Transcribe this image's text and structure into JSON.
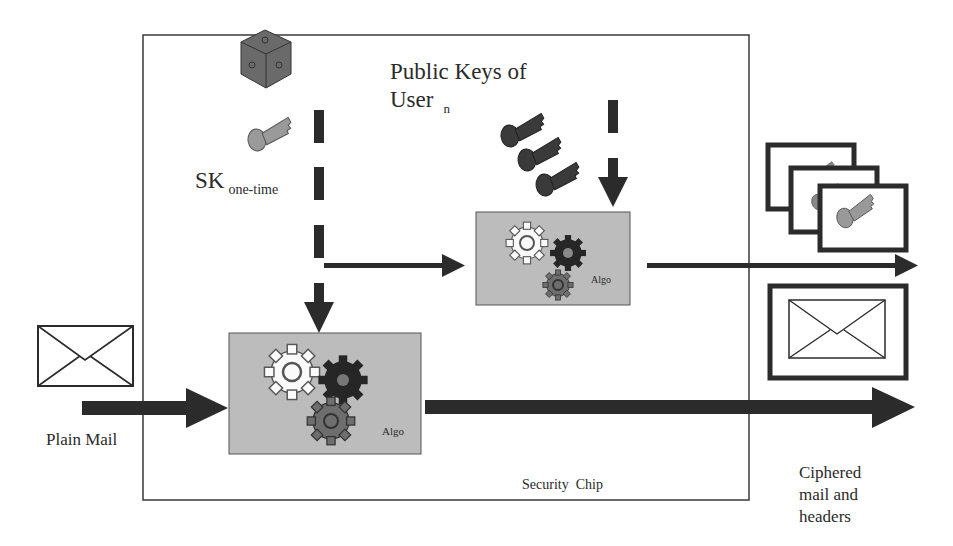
{
  "diagram": {
    "container": {
      "label": "Security  Chip"
    },
    "inputs": {
      "plain_mail": {
        "label": "Plain Mail",
        "icon": "envelope-icon"
      },
      "session_key": {
        "label": "SK",
        "subscript": "one-time",
        "icons": [
          "dice-icon",
          "key-icon"
        ]
      },
      "public_keys": {
        "label_line1": "Public Keys of",
        "label_line2": "User",
        "subscript": "n",
        "icon": "keys-icon",
        "count": 3
      }
    },
    "processors": [
      {
        "id": "algo-main",
        "label": "Algo"
      },
      {
        "id": "algo-keys",
        "label": "Algo"
      }
    ],
    "outputs": {
      "ciphered": {
        "label_line1": "Ciphered",
        "label_line2": "mail and",
        "label_line3": "headers"
      },
      "encrypted_keys": {
        "icon": "key-card-icon",
        "count": 3
      },
      "encrypted_mail": {
        "icon": "envelope-icon"
      }
    },
    "colors": {
      "line": "#2b2b2b",
      "algo_fill": "#b9b9b9",
      "gear_dark": "#262626",
      "gear_mid": "#6e6e6e",
      "key_dark": "#3a3a3a",
      "key_light": "#9a9a9a"
    }
  }
}
